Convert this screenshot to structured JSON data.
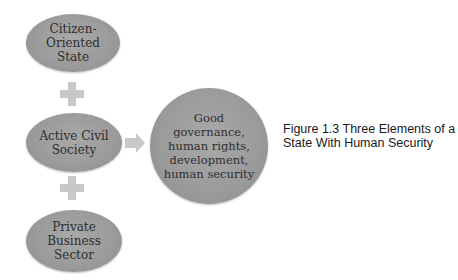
{
  "diagram": {
    "type": "converging-elements",
    "inputs": [
      {
        "id": "citizen-oriented-state",
        "label": "Citizen-\nOriented\nState"
      },
      {
        "id": "active-civil-society",
        "label": "Active Civil\nSociety"
      },
      {
        "id": "private-business-sector",
        "label": "Private\nBusiness\nSector"
      }
    ],
    "connectors": {
      "between_inputs": "plus",
      "to_output": "arrow-right"
    },
    "output": {
      "id": "outcome",
      "label": "Good\ngovernance,\nhuman rights,\ndevelopment,\nhuman security"
    },
    "colors": {
      "node_fill": "#9e9e9e",
      "node_text": "#2e2e2e",
      "connector_fill": "#c8c8c8",
      "background": "#ffffff"
    }
  },
  "caption": {
    "text": "Figure 1.3  Three Elements of a State With Human Security"
  }
}
